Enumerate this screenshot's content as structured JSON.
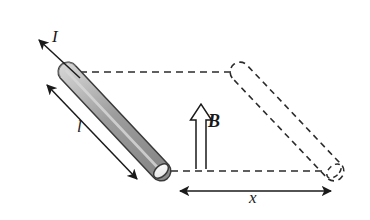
{
  "figure": {
    "background_color": "#ffffff",
    "width": 370,
    "height": 220,
    "stroke_color": "#1a1a1a",
    "dashed_color": "#2b2b2b",
    "rod_fill_color": "#9a9a9a",
    "rod_highlight_color": "#cfcfcf",
    "rod_outline_color": "#333333"
  },
  "labels": {
    "current": {
      "text": "I",
      "name": "current-label",
      "x": 52,
      "y": 28,
      "style": "italic"
    },
    "length": {
      "text": "l",
      "name": "length-label",
      "x": 77,
      "y": 118,
      "style": "italic"
    },
    "field": {
      "text": "B",
      "name": "magnetic-field-label",
      "x": 208,
      "y": 112,
      "style": "bold-italic"
    },
    "displacement": {
      "text": "x",
      "name": "displacement-label",
      "x": 249,
      "y": 189,
      "style": "italic"
    }
  },
  "elements": {
    "solid_rod": {
      "name": "conducting-rod-solid",
      "description": "shaded cylindrical conducting rod at initial position",
      "start": [
        68,
        72
      ],
      "end": [
        161,
        171
      ],
      "radius": 9,
      "fill": "#9a9a9a"
    },
    "dashed_rod": {
      "name": "conducting-rod-dashed",
      "description": "dashed outline of rod at displaced position",
      "start": [
        240,
        72
      ],
      "end": [
        334,
        171
      ],
      "radius": 9
    },
    "top_rail": {
      "name": "rail-top-dashed",
      "from": [
        78,
        72
      ],
      "to": [
        233,
        72
      ]
    },
    "bottom_rail": {
      "name": "rail-bottom-dashed",
      "from": [
        170,
        171
      ],
      "to": [
        327,
        171
      ]
    },
    "current_arrow": {
      "name": "current-arrow",
      "from": [
        79,
        77
      ],
      "to": [
        37,
        38
      ],
      "heads": 1
    },
    "length_arrow": {
      "name": "length-dimension-arrow",
      "from": [
        44,
        82
      ],
      "to": [
        139,
        181
      ],
      "heads": 2
    },
    "field_arrow": {
      "name": "magnetic-field-arrow",
      "from": [
        201,
        169
      ],
      "to": [
        201,
        104
      ],
      "style": "hollow-outline",
      "heads": 1
    },
    "displacement_arrow": {
      "name": "displacement-dimension-arrow",
      "from": [
        177,
        191
      ],
      "to": [
        334,
        191
      ],
      "heads": 2
    }
  }
}
